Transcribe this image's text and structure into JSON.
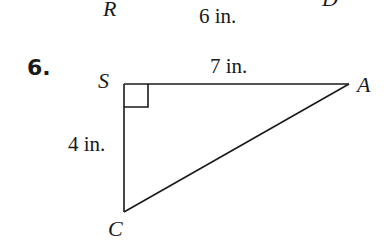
{
  "previous_figure": {
    "vertex_left": "R",
    "vertex_right": "D",
    "side_label": "6 in."
  },
  "problem": {
    "number": "6.",
    "triangle": {
      "vertices": {
        "top_left": "S",
        "right": "A",
        "bottom": "C"
      },
      "right_angle_at": "S",
      "sides": {
        "SA": "7 in.",
        "SC": "4 in."
      }
    }
  },
  "colors": {
    "ink": "#1a1a1a",
    "background": "#ffffff"
  }
}
